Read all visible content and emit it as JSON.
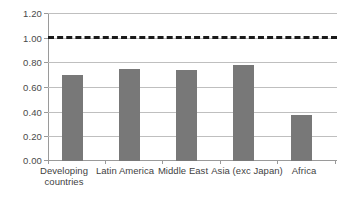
{
  "chart_data": {
    "type": "bar",
    "title": "",
    "subtitle": "",
    "xlabel": "",
    "ylabel": "",
    "categories": [
      "Developing countries",
      "Latin America",
      "Middle East",
      "Asia (exc Japan)",
      "Africa"
    ],
    "values": [
      0.7,
      0.75,
      0.74,
      0.78,
      0.37
    ],
    "series": [
      {
        "name": "ratio",
        "values": [
          0.7,
          0.75,
          0.74,
          0.78,
          0.37
        ],
        "color": "#787878"
      }
    ],
    "ylim": [
      0.0,
      1.2
    ],
    "ytick_step": 0.2,
    "ytick_labels": [
      "0.00",
      "0.20",
      "0.40",
      "0.60",
      "0.80",
      "1.00",
      "1.20"
    ],
    "ytick_values": [
      0.0,
      0.2,
      0.4,
      0.6,
      0.8,
      1.0,
      1.2
    ],
    "grid": true,
    "grid_color": "#bfbfbf",
    "legend": "none",
    "annotations": [
      {
        "type": "reference-line",
        "value": 1.0,
        "style": "dashed",
        "color": "#1a1a1a",
        "label": ""
      }
    ],
    "bar_color": "#787878",
    "background": "#ffffff"
  }
}
